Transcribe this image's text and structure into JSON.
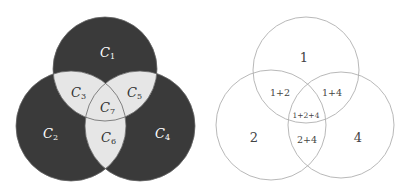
{
  "left_diagram": {
    "style": "filled",
    "colors": {
      "outer": "#3a3a3a",
      "overlap": "#e6e6e6",
      "stroke": "#555555"
    },
    "regions": [
      {
        "id": "c1",
        "label": "C",
        "sub": "1"
      },
      {
        "id": "c2",
        "label": "C",
        "sub": "2"
      },
      {
        "id": "c3",
        "label": "C",
        "sub": "3"
      },
      {
        "id": "c4",
        "label": "C",
        "sub": "4"
      },
      {
        "id": "c5",
        "label": "C",
        "sub": "5"
      },
      {
        "id": "c6",
        "label": "C",
        "sub": "6"
      },
      {
        "id": "c7",
        "label": "C",
        "sub": "7"
      }
    ]
  },
  "right_diagram": {
    "style": "outline",
    "colors": {
      "stroke": "#b0b0b0"
    },
    "regions": [
      {
        "id": "r1",
        "label": "1"
      },
      {
        "id": "r2",
        "label": "2"
      },
      {
        "id": "r4",
        "label": "4"
      },
      {
        "id": "r12",
        "label": "1+2"
      },
      {
        "id": "r14",
        "label": "1+4"
      },
      {
        "id": "r24",
        "label": "2+4"
      },
      {
        "id": "r124",
        "label": "1+2+4"
      }
    ]
  }
}
